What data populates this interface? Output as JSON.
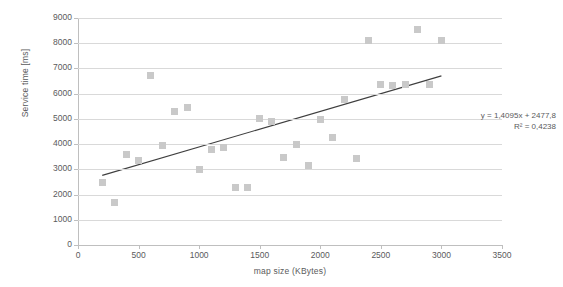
{
  "chart_data": {
    "type": "scatter",
    "title": "",
    "xlabel": "map size (KBytes)",
    "ylabel": "Service time [ms]",
    "xlim": [
      0,
      3500
    ],
    "ylim": [
      0,
      9000
    ],
    "xticks": [
      0,
      500,
      1000,
      1500,
      2000,
      2500,
      3000,
      3500
    ],
    "yticks": [
      0,
      1000,
      2000,
      3000,
      4000,
      5000,
      6000,
      7000,
      8000,
      9000
    ],
    "xtick_labels": [
      "0",
      "500",
      "1000",
      "1500",
      "2000",
      "2500",
      "3000",
      "3500"
    ],
    "ytick_labels": [
      "0",
      "1000",
      "2000",
      "3000",
      "4000",
      "5000",
      "6000",
      "7000",
      "8000",
      "9000"
    ],
    "grid": true,
    "grid_axis": "y",
    "legend": false,
    "marker_color": "#c9c9c9",
    "marker_shape": "square",
    "trendline_color": "#3f3f3f",
    "series": [
      {
        "name": "service time vs map size",
        "points": [
          [
            200,
            2480
          ],
          [
            300,
            1700
          ],
          [
            400,
            3600
          ],
          [
            500,
            3350
          ],
          [
            600,
            6720
          ],
          [
            700,
            3950
          ],
          [
            800,
            5300
          ],
          [
            900,
            5440
          ],
          [
            1000,
            3000
          ],
          [
            1100,
            3790
          ],
          [
            1200,
            3870
          ],
          [
            1300,
            2290
          ],
          [
            1400,
            2290
          ],
          [
            1500,
            5000
          ],
          [
            1600,
            4880
          ],
          [
            1700,
            3450
          ],
          [
            1800,
            3980
          ],
          [
            1900,
            3140
          ],
          [
            2000,
            4980
          ],
          [
            2100,
            4270
          ],
          [
            2200,
            5780
          ],
          [
            2300,
            3430
          ],
          [
            2400,
            8100
          ],
          [
            2500,
            6350
          ],
          [
            2600,
            6340
          ],
          [
            2700,
            6360
          ],
          [
            2800,
            8560
          ],
          [
            2900,
            6370
          ],
          [
            3000,
            8100
          ]
        ]
      }
    ],
    "trendline": {
      "type": "linear",
      "slope": 1.4095,
      "intercept": 2477.8,
      "r_squared": 0.4238,
      "x_start": 200,
      "x_end": 3000,
      "y_start": 2759.7,
      "y_end": 6706.3,
      "equation_label": "y = 1,4095x + 2477,8",
      "r_squared_label": "R² = 0,4238"
    }
  }
}
